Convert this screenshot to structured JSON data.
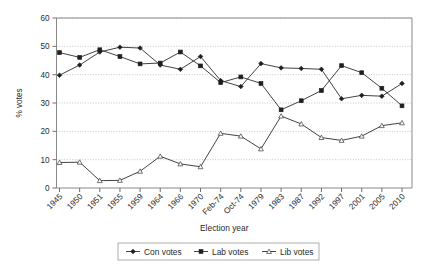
{
  "chart_data": {
    "type": "line",
    "title": "",
    "xlabel": "Election year",
    "ylabel": "% votes",
    "ylim": [
      0,
      60
    ],
    "yticks": [
      0,
      10,
      20,
      30,
      40,
      50,
      60
    ],
    "grid": "horizontal-dotted",
    "legend_position": "bottom-center",
    "categories": [
      "1945",
      "1950",
      "1951",
      "1955",
      "1959",
      "1964",
      "1966",
      "1970",
      "Feb-74",
      "Oct-74",
      "1979",
      "1983",
      "1987",
      "1992",
      "1997",
      "2001",
      "2005",
      "2010"
    ],
    "series": [
      {
        "name": "Con votes",
        "marker": "diamond",
        "values": [
          39.8,
          43.4,
          48.0,
          49.7,
          49.4,
          43.4,
          41.9,
          46.4,
          37.9,
          35.8,
          43.9,
          42.4,
          42.2,
          41.9,
          31.5,
          32.7,
          32.4,
          36.9
        ]
      },
      {
        "name": "Lab votes",
        "marker": "square",
        "values": [
          47.8,
          46.1,
          48.8,
          46.4,
          43.8,
          44.1,
          48.0,
          43.1,
          37.2,
          39.2,
          36.9,
          27.6,
          30.8,
          34.4,
          43.2,
          40.7,
          35.2,
          29.0
        ]
      },
      {
        "name": "Lib votes",
        "marker": "triangle",
        "values": [
          9.0,
          9.1,
          2.6,
          2.7,
          5.9,
          11.2,
          8.5,
          7.5,
          19.3,
          18.3,
          13.8,
          25.4,
          22.6,
          17.8,
          16.8,
          18.3,
          22.0,
          23.0
        ]
      }
    ]
  },
  "legend": {
    "entries": [
      {
        "label": "Con votes",
        "marker": "diamond"
      },
      {
        "label": "Lab votes",
        "marker": "square"
      },
      {
        "label": "Lib votes",
        "marker": "triangle"
      }
    ]
  }
}
